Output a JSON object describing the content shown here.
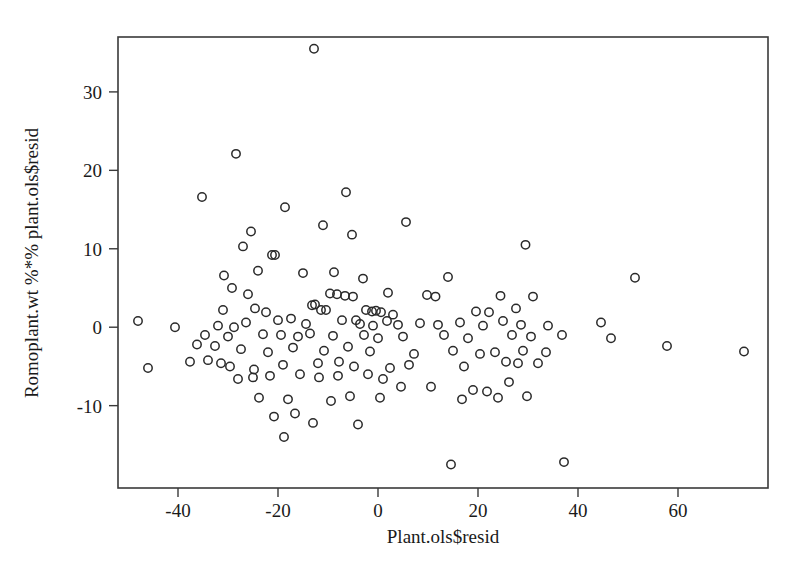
{
  "chart_data": {
    "type": "scatter",
    "title": "",
    "subtitle": "",
    "xlabel": "Plant.ols$resid",
    "ylabel": "Romoplant.wt %*% plant.ols$resid",
    "xlim": [
      -52,
      78
    ],
    "ylim": [
      -20.5,
      37
    ],
    "xticks": [
      -40,
      -20,
      0,
      20,
      40,
      60
    ],
    "xtick_labels": [
      "-40",
      "-20",
      "0",
      "20",
      "40",
      "60"
    ],
    "yticks": [
      -10,
      0,
      10,
      20,
      30
    ],
    "ytick_labels": [
      "-10",
      "0",
      "10",
      "20",
      "30"
    ],
    "grid": false,
    "legend": null,
    "marker": "open-circle",
    "marker_color": "#2a2a2a",
    "marker_size": 4.2,
    "n_points": 142,
    "annotations": [],
    "points": [
      [
        -12.8,
        35.5
      ],
      [
        -28.4,
        22.1
      ],
      [
        -35.2,
        16.6
      ],
      [
        -6.4,
        17.2
      ],
      [
        -18.6,
        15.3
      ],
      [
        -11.0,
        13.0
      ],
      [
        5.6,
        13.4
      ],
      [
        -5.2,
        11.8
      ],
      [
        -25.4,
        12.2
      ],
      [
        -27.0,
        10.3
      ],
      [
        29.5,
        10.5
      ],
      [
        -21.2,
        9.2
      ],
      [
        -20.6,
        9.2
      ],
      [
        -30.8,
        6.6
      ],
      [
        -24.0,
        7.2
      ],
      [
        -15.0,
        6.9
      ],
      [
        -8.8,
        7.0
      ],
      [
        -3.0,
        6.2
      ],
      [
        14.0,
        6.4
      ],
      [
        51.4,
        6.3
      ],
      [
        -29.2,
        5.0
      ],
      [
        -26.0,
        4.2
      ],
      [
        -9.6,
        4.3
      ],
      [
        -8.2,
        4.2
      ],
      [
        -6.6,
        4.0
      ],
      [
        -5.0,
        3.9
      ],
      [
        2.0,
        4.4
      ],
      [
        9.8,
        4.1
      ],
      [
        11.5,
        3.9
      ],
      [
        24.5,
        4.0
      ],
      [
        31.0,
        3.9
      ],
      [
        -31.0,
        2.2
      ],
      [
        -24.6,
        2.4
      ],
      [
        -22.4,
        1.9
      ],
      [
        -13.2,
        2.8
      ],
      [
        -12.6,
        2.9
      ],
      [
        -11.4,
        2.2
      ],
      [
        -10.4,
        2.2
      ],
      [
        -2.4,
        2.2
      ],
      [
        -1.2,
        2.0
      ],
      [
        -0.4,
        2.1
      ],
      [
        0.6,
        1.9
      ],
      [
        3.0,
        1.6
      ],
      [
        19.6,
        2.0
      ],
      [
        22.2,
        1.9
      ],
      [
        27.6,
        2.4
      ],
      [
        -32.0,
        0.2
      ],
      [
        -28.8,
        0.0
      ],
      [
        -26.4,
        0.6
      ],
      [
        -20.0,
        0.9
      ],
      [
        -17.4,
        1.1
      ],
      [
        -14.4,
        0.4
      ],
      [
        -7.2,
        0.9
      ],
      [
        -4.4,
        0.9
      ],
      [
        -3.6,
        0.4
      ],
      [
        -1.0,
        0.2
      ],
      [
        1.8,
        0.8
      ],
      [
        4.0,
        0.3
      ],
      [
        8.4,
        0.5
      ],
      [
        12.0,
        0.3
      ],
      [
        16.4,
        0.6
      ],
      [
        21.0,
        0.2
      ],
      [
        25.0,
        0.8
      ],
      [
        28.6,
        0.3
      ],
      [
        34.0,
        0.2
      ],
      [
        44.6,
        0.6
      ],
      [
        -48.0,
        0.8
      ],
      [
        -40.6,
        0.0
      ],
      [
        -34.6,
        -1.0
      ],
      [
        -30.0,
        -1.2
      ],
      [
        -23.0,
        -0.9
      ],
      [
        -19.4,
        -1.0
      ],
      [
        -16.0,
        -1.2
      ],
      [
        -13.6,
        -0.8
      ],
      [
        -9.0,
        -1.1
      ],
      [
        -2.8,
        -1.0
      ],
      [
        0.0,
        -1.4
      ],
      [
        5.0,
        -1.2
      ],
      [
        13.2,
        -1.0
      ],
      [
        18.0,
        -1.4
      ],
      [
        26.8,
        -1.0
      ],
      [
        30.6,
        -1.2
      ],
      [
        36.8,
        -1.0
      ],
      [
        46.6,
        -1.4
      ],
      [
        -36.2,
        -2.2
      ],
      [
        -32.6,
        -2.4
      ],
      [
        -27.4,
        -2.8
      ],
      [
        -22.0,
        -3.2
      ],
      [
        -17.0,
        -2.6
      ],
      [
        -10.8,
        -3.0
      ],
      [
        -6.0,
        -2.5
      ],
      [
        -1.6,
        -3.1
      ],
      [
        7.2,
        -3.4
      ],
      [
        15.0,
        -3.0
      ],
      [
        20.4,
        -3.4
      ],
      [
        23.4,
        -3.2
      ],
      [
        29.0,
        -3.0
      ],
      [
        33.6,
        -3.2
      ],
      [
        57.8,
        -2.4
      ],
      [
        73.2,
        -3.1
      ],
      [
        -46.0,
        -5.2
      ],
      [
        -37.6,
        -4.4
      ],
      [
        -34.0,
        -4.2
      ],
      [
        -31.4,
        -4.6
      ],
      [
        -29.6,
        -5.0
      ],
      [
        -24.8,
        -5.4
      ],
      [
        -19.0,
        -4.8
      ],
      [
        -12.0,
        -4.6
      ],
      [
        -7.8,
        -4.4
      ],
      [
        -4.8,
        -5.0
      ],
      [
        2.4,
        -5.2
      ],
      [
        6.2,
        -4.8
      ],
      [
        17.2,
        -5.0
      ],
      [
        25.6,
        -4.4
      ],
      [
        28.0,
        -4.6
      ],
      [
        32.0,
        -4.6
      ],
      [
        -28.0,
        -6.6
      ],
      [
        -25.0,
        -6.4
      ],
      [
        -21.6,
        -6.2
      ],
      [
        -15.6,
        -6.0
      ],
      [
        -11.8,
        -6.4
      ],
      [
        -8.0,
        -6.2
      ],
      [
        -2.0,
        -6.0
      ],
      [
        1.0,
        -6.6
      ],
      [
        4.6,
        -7.6
      ],
      [
        10.6,
        -7.6
      ],
      [
        19.0,
        -8.0
      ],
      [
        21.8,
        -8.2
      ],
      [
        26.2,
        -7.0
      ],
      [
        -23.8,
        -9.0
      ],
      [
        -18.0,
        -9.2
      ],
      [
        -9.4,
        -9.4
      ],
      [
        -5.6,
        -8.8
      ],
      [
        0.4,
        -9.0
      ],
      [
        16.8,
        -9.2
      ],
      [
        24.0,
        -9.0
      ],
      [
        29.8,
        -8.8
      ],
      [
        -20.8,
        -11.4
      ],
      [
        -16.6,
        -11.0
      ],
      [
        -13.0,
        -12.2
      ],
      [
        -4.0,
        -12.4
      ],
      [
        -18.8,
        -14.0
      ],
      [
        14.6,
        -17.5
      ],
      [
        37.2,
        -17.2
      ]
    ]
  },
  "axes": {
    "frame": {
      "left": 118,
      "top": 37,
      "right": 768,
      "bottom": 488
    }
  }
}
